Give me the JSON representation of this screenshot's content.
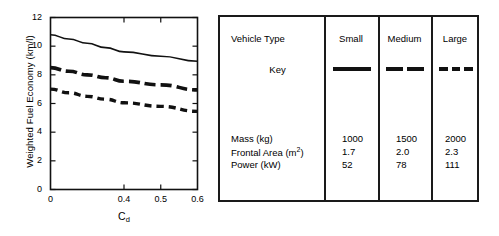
{
  "chart_data": {
    "type": "line",
    "title": "",
    "xlabel": "Cd",
    "xlabel_base": "C",
    "xlabel_sub": "d",
    "ylabel": "Weighted Fuel Economy (km/l)",
    "xlim": [
      0,
      0.6
    ],
    "ylim": [
      0,
      12
    ],
    "grid": false,
    "legend_position": "external-table",
    "y_ticks": [
      0,
      2,
      4,
      6,
      8,
      10,
      12
    ],
    "y_tick_labels": [
      "0",
      "2",
      "4",
      "6",
      "8",
      "10",
      "12"
    ],
    "x_ticks": [
      0,
      0.4,
      0.5,
      0.6
    ],
    "x_tick_labels": [
      "0",
      "0.4",
      "0.5",
      "0.6"
    ],
    "x_tick_fractions": [
      0.0,
      0.5,
      0.75,
      1.0
    ],
    "series": [
      {
        "name": "Small",
        "style": "solid",
        "x": [
          0.0,
          0.1,
          0.2,
          0.3,
          0.4,
          0.5,
          0.6
        ],
        "values": [
          10.8,
          10.5,
          10.2,
          9.9,
          9.6,
          9.3,
          8.95
        ]
      },
      {
        "name": "Medium",
        "style": "long-dash",
        "x": [
          0.0,
          0.1,
          0.2,
          0.3,
          0.4,
          0.5,
          0.6
        ],
        "values": [
          8.5,
          8.25,
          8.0,
          7.8,
          7.55,
          7.3,
          6.95
        ]
      },
      {
        "name": "Large",
        "style": "short-dash",
        "x": [
          0.0,
          0.1,
          0.2,
          0.3,
          0.4,
          0.5,
          0.6
        ],
        "values": [
          7.0,
          6.75,
          6.5,
          6.3,
          6.05,
          5.8,
          5.45
        ]
      }
    ]
  },
  "table": {
    "header_row_label": "Vehicle Type",
    "columns": [
      "Small",
      "Medium",
      "Large"
    ],
    "key_row_label": "Key",
    "key_styles": [
      "solid",
      "long-dash",
      "short-dash"
    ],
    "rows": [
      {
        "label": "Mass (kg)",
        "label_base": "Mass (kg)",
        "sup": "",
        "values": [
          "1000",
          "1500",
          "2000"
        ]
      },
      {
        "label": "Frontal Area (m2)",
        "label_base": "Frontal Area (m",
        "sup": "2",
        "label_tail": ")",
        "values": [
          "1.7",
          "2.0",
          "2.3"
        ]
      },
      {
        "label": "Power (kW)",
        "label_base": "Power (kW)",
        "sup": "",
        "values": [
          "52",
          "78",
          "111"
        ]
      }
    ]
  },
  "colors": {
    "ink": "#111111",
    "frame": "#1a1a1a",
    "background": "#ffffff"
  }
}
